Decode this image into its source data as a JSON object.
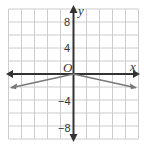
{
  "chart_data": {
    "type": "line",
    "title": "",
    "xlabel": "x",
    "ylabel": "y",
    "origin_label": "O",
    "xlim": [
      -10,
      10
    ],
    "ylim": [
      -10,
      10
    ],
    "grid": true,
    "grid_step": 2,
    "y_tick_labels": [
      "8",
      "4",
      "−4",
      "−8"
    ],
    "y_tick_values": [
      8,
      4,
      -4,
      -8
    ],
    "series": [
      {
        "name": "graph",
        "x": [
          -10,
          0,
          10
        ],
        "values": [
          -2,
          0,
          -2
        ],
        "color": "#777777"
      }
    ]
  },
  "colors": {
    "axis": "#333333",
    "grid": "#cccccc",
    "line": "#777777"
  }
}
